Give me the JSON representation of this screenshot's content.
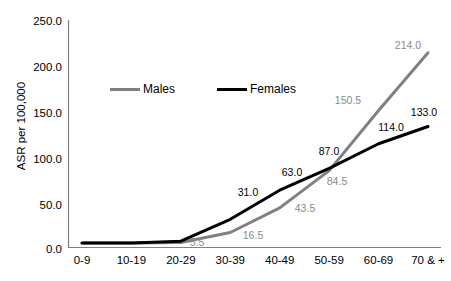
{
  "chart_data": {
    "type": "line",
    "title": "",
    "xlabel": "",
    "ylabel": "ASR per 100,000",
    "categories": [
      "0-9",
      "10-19",
      "20-29",
      "30-39",
      "40-49",
      "50-59",
      "60-69",
      "70 & +"
    ],
    "ylim": [
      0,
      250
    ],
    "y_ticks": [
      "0.0",
      "50.0",
      "100.0",
      "150.0",
      "200.0",
      "250.0"
    ],
    "y_tick_values": [
      0,
      50,
      100,
      150,
      200,
      250
    ],
    "grid": false,
    "legend_position": "top-center-inside",
    "series": [
      {
        "name": "Males",
        "color": "#808080",
        "values": [
          5.0,
          5.0,
          5.5,
          16.5,
          43.5,
          84.5,
          150.5,
          214.0
        ],
        "labels": [
          "",
          "",
          "5.5",
          "16.5",
          "43.5",
          "84.5",
          "150.5",
          "214.0"
        ]
      },
      {
        "name": "Females",
        "color": "#000000",
        "values": [
          5.0,
          5.0,
          7.0,
          31.0,
          63.0,
          87.0,
          114.0,
          133.0
        ],
        "labels": [
          "",
          "",
          "",
          "31.0",
          "63.0",
          "87.0",
          "114.0",
          "133.0"
        ]
      }
    ]
  },
  "axis": {
    "y_title": "ASR per 100,000",
    "y_tick_labels": [
      "250.0",
      "200.0",
      "150.0",
      "100.0",
      "50.0",
      "0.0"
    ],
    "x_tick_labels": [
      "0-9",
      "10-19",
      "20-29",
      "30-39",
      "40-49",
      "50-59",
      "60-69",
      "70 & +"
    ]
  },
  "legend": {
    "items": [
      {
        "label": "Males",
        "color": "#808080"
      },
      {
        "label": "Females",
        "color": "#000000"
      }
    ]
  },
  "data_labels": {
    "males": [
      {
        "text": "5.5",
        "x": 197,
        "y": 242
      },
      {
        "text": "16.5",
        "x": 253,
        "y": 235
      },
      {
        "text": "43.5",
        "x": 305,
        "y": 208
      },
      {
        "text": "84.5",
        "x": 337,
        "y": 181
      },
      {
        "text": "150.5",
        "x": 348,
        "y": 100
      },
      {
        "text": "214.0",
        "x": 408,
        "y": 45
      }
    ],
    "females": [
      {
        "text": "31.0",
        "x": 248,
        "y": 192
      },
      {
        "text": "63.0",
        "x": 292,
        "y": 172
      },
      {
        "text": "87.0",
        "x": 329,
        "y": 151
      },
      {
        "text": "114.0",
        "x": 391,
        "y": 127
      },
      {
        "text": "133.0",
        "x": 424,
        "y": 112
      }
    ]
  }
}
